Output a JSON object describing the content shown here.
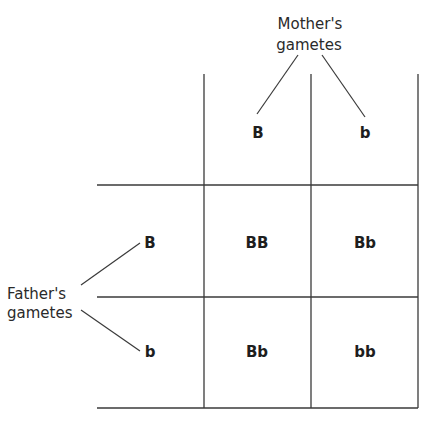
{
  "mother": {
    "label_line1": "Mother's",
    "label_line2": "gametes",
    "alleles": [
      "B",
      "b"
    ]
  },
  "father": {
    "label_line1": "Father's",
    "label_line2": "gametes",
    "alleles": [
      "B",
      "b"
    ]
  },
  "grid": {
    "rows": [
      [
        "BB",
        "Bb"
      ],
      [
        "Bb",
        "bb"
      ]
    ]
  },
  "colors": {
    "line": "#3a3a3a",
    "text": "#1e1e1e",
    "background": "#ffffff"
  }
}
